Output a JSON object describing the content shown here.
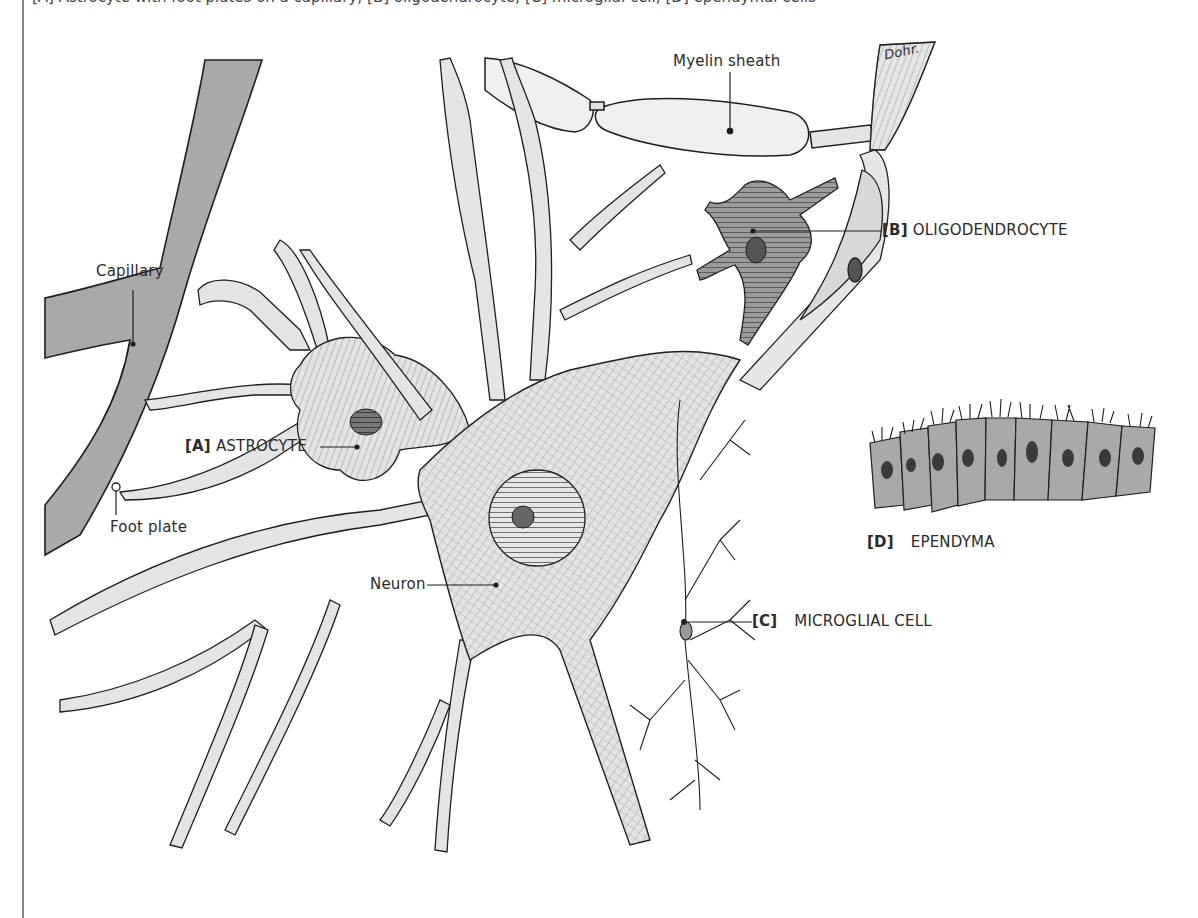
{
  "caption": {
    "text": "[A] Astrocyte with foot plates on a capillary; [B] oligodendrocyte; [C] microglial cell; [D] ependymal cells"
  },
  "labels": {
    "myelin_sheath": "Myelin sheath",
    "capillary": "Capillary",
    "foot_plate": "Foot plate",
    "neuron": "Neuron",
    "astrocyte": {
      "tag": "[A]",
      "text": "ASTROCYTE"
    },
    "oligodendrocyte": {
      "tag": "[B]",
      "text": "OLIGODENDROCYTE"
    },
    "microglial": {
      "tag": "[C]",
      "text": "MICROGLIAL CELL"
    },
    "ependyma": {
      "tag": "[D]",
      "text": "EPENDYMA"
    },
    "signature": "Dohr."
  },
  "colors": {
    "capillary_fill": "#a9a9a9",
    "cell_fill": "#e4e4e4",
    "dark_cell_fill": "#9c9c9c",
    "ink": "#1e1e1e",
    "border_rule": "#8a8a8a"
  }
}
